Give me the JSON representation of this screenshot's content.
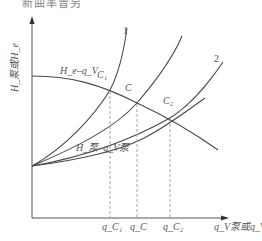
{
  "caption": "新曲率曾另",
  "axes": {
    "y_label": "H_泵或H_e",
    "x_label": "q_V泵或q_V"
  },
  "curves": {
    "pump_curve_label": "H_e–q_V",
    "system_curve_label": "H_泵–q_V泵",
    "curve_1_label": "1",
    "curve_2_label": "2"
  },
  "points": {
    "c1": "C₁",
    "c": "C",
    "c2": "C₂"
  },
  "x_ticks": {
    "q_c1": "q_C₁",
    "q_c": "q_C",
    "q_c2": "q_C₂"
  },
  "colors": {
    "line": "#4a4a4a",
    "dashed": "#9a9a9a",
    "text": "#555555"
  }
}
